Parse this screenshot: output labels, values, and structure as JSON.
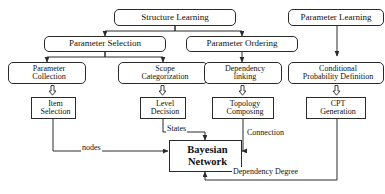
{
  "diagram": {
    "title_top_left": "Structure Learning",
    "title_top_right": "Parameter Learning",
    "nodes": [
      {
        "id": "structure-learning",
        "label": "Structure Learning",
        "shape": "rounded"
      },
      {
        "id": "parameter-learning",
        "label": "Parameter Learning",
        "shape": "rounded"
      },
      {
        "id": "parameter-selection",
        "label": "Parameter Selection",
        "shape": "rounded"
      },
      {
        "id": "parameter-ordering",
        "label": "Parameter Ordering",
        "shape": "rounded"
      },
      {
        "id": "parameter-collection",
        "label_line1": "Parameter",
        "label_line2": "Collection",
        "shape": "rounded"
      },
      {
        "id": "scope-categorization",
        "label_line1": "Scope",
        "label_line2": "Categorization",
        "shape": "rounded"
      },
      {
        "id": "dependency-linking",
        "label_line1": "Dependency",
        "label_line2": "linking",
        "shape": "rounded"
      },
      {
        "id": "conditional-probability-definition",
        "label_line1": "Conditional",
        "label_line2": "Probability Definition",
        "shape": "rounded"
      },
      {
        "id": "item-selection",
        "label_line1": "Item",
        "label_line2": "Selection",
        "shape": "sharp"
      },
      {
        "id": "level-decision",
        "label_line1": "Level",
        "label_line2": "Decision",
        "shape": "sharp"
      },
      {
        "id": "topology-composing",
        "label_line1": "Topology",
        "label_line2": "Composing",
        "shape": "sharp"
      },
      {
        "id": "cpt-generation",
        "label_line1": "CPT",
        "label_line2": "Generation",
        "shape": "sharp"
      },
      {
        "id": "bayesian-network",
        "label_line1": "Bayesian",
        "label_line2": "Network",
        "shape": "sharp"
      }
    ],
    "edge_labels": {
      "nodes": "nodes",
      "states": "States",
      "connection": "Connection",
      "dependency_degree": "Dependency Degree"
    },
    "colors": {
      "stroke": "#2a2a2a",
      "text": "#111111",
      "background": "#ffffff"
    }
  }
}
